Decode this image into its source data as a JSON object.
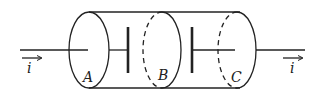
{
  "diagram": {
    "type": "capacitor-cylinder-circuit",
    "labels": {
      "current_left": "i",
      "current_right": "i",
      "section_a": "A",
      "section_b": "B",
      "section_c": "C"
    },
    "colors": {
      "line": "#222222",
      "background": "#ffffff"
    }
  }
}
